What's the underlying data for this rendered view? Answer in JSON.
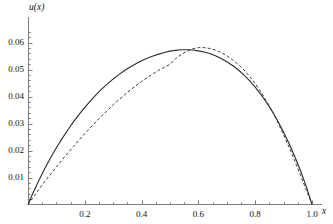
{
  "chart_data": {
    "type": "line",
    "title": "",
    "xlabel": "x",
    "ylabel": "u(x)",
    "xlim": [
      0,
      1.04
    ],
    "ylim": [
      0,
      0.0655
    ],
    "grid": false,
    "legend": "none",
    "xticks": [
      {
        "value": 0.2,
        "label": "0.2"
      },
      {
        "value": 0.4,
        "label": "0.4"
      },
      {
        "value": 0.6,
        "label": "0.6"
      },
      {
        "value": 0.8,
        "label": "0.8"
      },
      {
        "value": 1.0,
        "label": "1.0"
      }
    ],
    "yticks": [
      {
        "value": 0.01,
        "label": "0.01"
      },
      {
        "value": 0.02,
        "label": "0.02"
      },
      {
        "value": 0.03,
        "label": "0.03"
      },
      {
        "value": 0.04,
        "label": "0.04"
      },
      {
        "value": 0.05,
        "label": "0.05"
      },
      {
        "value": 0.06,
        "label": "0.06"
      }
    ],
    "x_minor_tick_step": 0.05,
    "y_minor_tick_step": 0.002,
    "series": [
      {
        "name": "solid-curve",
        "style": "solid",
        "color": "#2b2b2b",
        "width": 1.1,
        "peak_x": 0.49,
        "peak_y": 0.0575,
        "x": [
          0.0,
          0.02,
          0.04,
          0.06,
          0.08,
          0.1,
          0.12,
          0.14,
          0.16,
          0.18,
          0.2,
          0.22,
          0.24,
          0.26,
          0.28,
          0.3,
          0.32,
          0.34,
          0.36,
          0.38,
          0.4,
          0.42,
          0.44,
          0.46,
          0.48,
          0.5,
          0.52,
          0.54,
          0.56,
          0.58,
          0.6,
          0.62,
          0.64,
          0.66,
          0.68,
          0.7,
          0.72,
          0.74,
          0.76,
          0.78,
          0.8,
          0.82,
          0.84,
          0.86,
          0.88,
          0.9,
          0.92,
          0.94,
          0.96,
          0.98,
          1.0
        ],
        "y": [
          0.0,
          0.0048,
          0.0093,
          0.0135,
          0.0174,
          0.021,
          0.0244,
          0.0276,
          0.0306,
          0.0334,
          0.036,
          0.0384,
          0.0407,
          0.0428,
          0.0447,
          0.0465,
          0.0481,
          0.0496,
          0.0509,
          0.0521,
          0.0532,
          0.0542,
          0.055,
          0.0557,
          0.0563,
          0.0568,
          0.0571,
          0.0573,
          0.0573,
          0.0572,
          0.0569,
          0.0565,
          0.0559,
          0.0551,
          0.0541,
          0.0529,
          0.0515,
          0.0499,
          0.048,
          0.0459,
          0.0435,
          0.0408,
          0.0378,
          0.0345,
          0.0308,
          0.0268,
          0.0224,
          0.0176,
          0.0124,
          0.0066,
          0.0
        ]
      },
      {
        "name": "dashed-curve",
        "style": "dashed",
        "color": "#3a3a3a",
        "width": 1.0,
        "dash_pattern": "3,2.2",
        "peak_x": 0.58,
        "peak_y": 0.0582,
        "x": [
          0.0,
          0.02,
          0.04,
          0.06,
          0.08,
          0.1,
          0.12,
          0.14,
          0.16,
          0.18,
          0.2,
          0.22,
          0.24,
          0.26,
          0.28,
          0.3,
          0.32,
          0.34,
          0.36,
          0.38,
          0.4,
          0.42,
          0.44,
          0.46,
          0.48,
          0.5,
          0.52,
          0.54,
          0.56,
          0.58,
          0.6,
          0.62,
          0.64,
          0.66,
          0.68,
          0.7,
          0.72,
          0.74,
          0.76,
          0.78,
          0.8,
          0.82,
          0.84,
          0.86,
          0.88,
          0.9,
          0.92,
          0.94,
          0.96,
          0.98,
          1.0
        ],
        "y": [
          0.0,
          0.0029,
          0.0058,
          0.0086,
          0.0113,
          0.0139,
          0.0165,
          0.019,
          0.0215,
          0.0239,
          0.0262,
          0.0285,
          0.0307,
          0.0328,
          0.0349,
          0.0369,
          0.0388,
          0.0406,
          0.0424,
          0.044,
          0.0456,
          0.047,
          0.0484,
          0.0497,
          0.0508,
          0.0519,
          0.0541,
          0.0556,
          0.0568,
          0.0577,
          0.0581,
          0.0581,
          0.0578,
          0.0572,
          0.0563,
          0.0551,
          0.0536,
          0.0519,
          0.0499,
          0.0475,
          0.0448,
          0.0417,
          0.0383,
          0.0345,
          0.0303,
          0.0258,
          0.0211,
          0.016,
          0.0107,
          0.0054,
          0.0
        ]
      }
    ]
  },
  "axes": {
    "y_axis_title": "u(x)",
    "x_axis_title": "x"
  }
}
